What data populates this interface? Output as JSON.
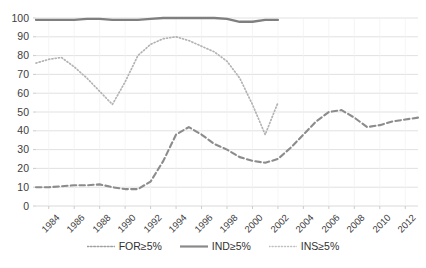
{
  "chart_data": {
    "type": "line",
    "title": "",
    "subtitle": "",
    "xlabel": "",
    "ylabel": "",
    "xlim": [
      1983,
      2013
    ],
    "ylim": [
      0,
      100
    ],
    "ytick_step": 10,
    "yticks": [
      0,
      10,
      20,
      30,
      40,
      50,
      60,
      70,
      80,
      90,
      100
    ],
    "xticks": [
      1984,
      1986,
      1988,
      1990,
      1992,
      1994,
      1996,
      1998,
      2000,
      2002,
      2004,
      2006,
      2008,
      2010,
      2012
    ],
    "xtick_labels": [
      "1984",
      "1986",
      "1988",
      "1990",
      "1992",
      "1994",
      "1996",
      "1998",
      "2000",
      "2002",
      "2004",
      "2006",
      "2008",
      "2010",
      "2012"
    ],
    "grid": true,
    "grid_axis": "y",
    "legend_position": "bottom",
    "series": [
      {
        "name": "FOR≥5%",
        "style": "dashed",
        "color": "#8c8c8c",
        "x": [
          1983,
          1984,
          1985,
          1986,
          1987,
          1988,
          1989,
          1990,
          1991,
          1992,
          1993,
          1994,
          1995,
          1996,
          1997,
          1998,
          1999,
          2000,
          2001,
          2002,
          2003,
          2004,
          2005,
          2006,
          2007,
          2008,
          2009,
          2010,
          2011,
          2012,
          2013
        ],
        "values": [
          10,
          10,
          10.5,
          11,
          11,
          11.5,
          10,
          9,
          9,
          13,
          24,
          38,
          42,
          38,
          33,
          30,
          26,
          24,
          23,
          25,
          31,
          38,
          45,
          50,
          51,
          47,
          42,
          43,
          45,
          46,
          47
        ]
      },
      {
        "name": "IND≥5%",
        "style": "solid",
        "color": "#7f7f7f",
        "x": [
          1983,
          1984,
          1985,
          1986,
          1987,
          1988,
          1989,
          1990,
          1991,
          1992,
          1993,
          1994,
          1995,
          1996,
          1997,
          1998,
          1999,
          2000,
          2001,
          2002
        ],
        "values": [
          99,
          99,
          99,
          99,
          99.5,
          99.5,
          99,
          99,
          99,
          99.5,
          100,
          100,
          100,
          100,
          100,
          99.5,
          98,
          98,
          99,
          99
        ]
      },
      {
        "name": "INS≥5%",
        "style": "dotted",
        "color": "#b3b3b3",
        "x": [
          1983,
          1984,
          1985,
          1986,
          1987,
          1988,
          1989,
          1990,
          1991,
          1992,
          1993,
          1994,
          1995,
          1996,
          1997,
          1998,
          1999,
          2000,
          2001,
          2002
        ],
        "values": [
          76,
          78,
          79,
          74,
          68,
          61,
          54,
          66,
          80,
          86,
          89,
          90,
          88,
          85,
          82,
          77,
          68,
          54,
          38,
          55
        ]
      }
    ]
  },
  "legend": {
    "items": [
      {
        "label": "FOR≥5%",
        "style": "dotted-dash",
        "color": "#a0a0a0"
      },
      {
        "label": "IND≥5%",
        "style": "solid",
        "color": "#8a8a8a"
      },
      {
        "label": "INS≥5%",
        "style": "dotted",
        "color": "#b8b8b8"
      }
    ]
  }
}
